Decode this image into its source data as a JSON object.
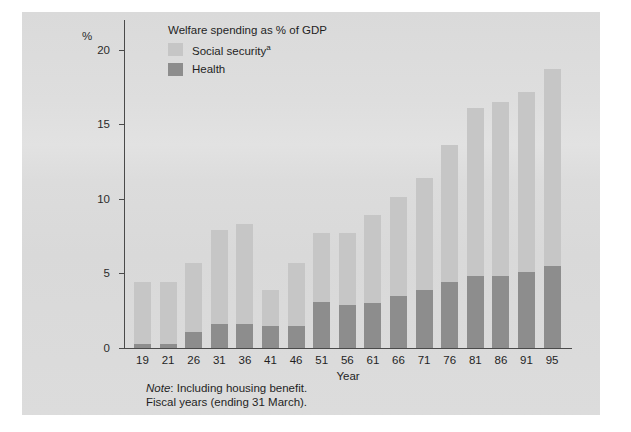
{
  "figure": {
    "y_unit_label": "%",
    "legend_title": "Welfare spending as % of GDP",
    "legend": [
      {
        "label": "Social security",
        "marker": "a",
        "color": "#c6c6c6",
        "key": "social-security"
      },
      {
        "label": "Health",
        "marker": "",
        "color": "#8d8d8d",
        "key": "health"
      }
    ],
    "note_line1_lead": "Note",
    "note_line1_rest": ": Including housing benefit.",
    "note_line2": "Fiscal years (ending 31 March)."
  },
  "chart_data": {
    "type": "bar",
    "stacked": true,
    "title": "Welfare spending as % of GDP",
    "xlabel": "Year",
    "ylabel": "%",
    "ylim": [
      0,
      22
    ],
    "yticks": [
      0,
      5,
      10,
      15,
      20
    ],
    "ytick_labels": [
      "0",
      "5",
      "10",
      "15",
      "20"
    ],
    "grid": false,
    "legend_position": "top-left-inside",
    "categories": [
      "19",
      "21",
      "26",
      "31",
      "36",
      "41",
      "46",
      "51",
      "56",
      "61",
      "66",
      "71",
      "76",
      "81",
      "86",
      "91",
      "95"
    ],
    "series": [
      {
        "name": "Health",
        "color": "#8d8d8d",
        "values": [
          0.3,
          0.3,
          1.1,
          1.6,
          1.6,
          1.5,
          1.5,
          3.1,
          2.9,
          3.0,
          3.5,
          3.9,
          4.4,
          4.8,
          4.8,
          5.1,
          5.5
        ]
      },
      {
        "name": "Social security",
        "color": "#c6c6c6",
        "values": [
          4.1,
          4.1,
          4.6,
          6.3,
          6.7,
          2.4,
          4.2,
          4.6,
          4.8,
          5.9,
          6.6,
          7.5,
          9.2,
          11.3,
          11.7,
          12.1,
          13.2
        ]
      }
    ],
    "totals": [
      4.4,
      4.4,
      5.7,
      7.9,
      8.3,
      3.9,
      5.7,
      7.7,
      7.7,
      8.9,
      10.1,
      11.4,
      13.6,
      16.1,
      16.5,
      17.2,
      18.7
    ],
    "annotations": [
      "Note: Including housing benefit.",
      "Fiscal years (ending 31 March)."
    ]
  }
}
